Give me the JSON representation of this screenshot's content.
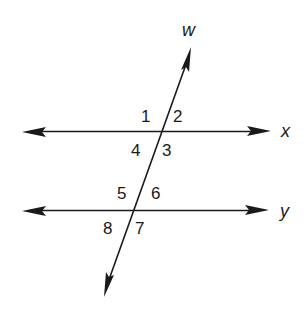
{
  "diagram": {
    "type": "parallel lines cut by a transversal",
    "lines": {
      "transversal": {
        "label": "w"
      },
      "upper": {
        "label": "x"
      },
      "lower": {
        "label": "y"
      }
    },
    "angles": {
      "a1": "1",
      "a2": "2",
      "a3": "3",
      "a4": "4",
      "a5": "5",
      "a6": "6",
      "a7": "7",
      "a8": "8"
    },
    "colors": {
      "ink": "#1a1a1a",
      "background": "#ffffff"
    }
  }
}
